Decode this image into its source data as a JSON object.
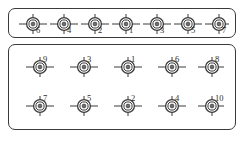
{
  "diagram": {
    "stroke_color": "#3a3a3a",
    "label_color": "#2e2e2e",
    "background_color": "#ffffff",
    "panels": [
      {
        "id": "panel-top",
        "name": "single-row-group",
        "label_position": "subscript",
        "rows": [
          {
            "name": "row-1",
            "markers": [
              {
                "label": "6"
              },
              {
                "label": "4"
              },
              {
                "label": "2"
              },
              {
                "label": "1"
              },
              {
                "label": "3"
              },
              {
                "label": "5"
              },
              {
                "label": "7"
              }
            ]
          }
        ]
      },
      {
        "id": "panel-bottom",
        "name": "two-row-group",
        "label_position": "superscript",
        "rows": [
          {
            "name": "row-1",
            "markers": [
              {
                "label": "9"
              },
              {
                "label": "3"
              },
              {
                "label": "1"
              },
              {
                "label": "6"
              },
              {
                "label": "8"
              }
            ]
          },
          {
            "name": "row-2",
            "markers": [
              {
                "label": "7"
              },
              {
                "label": "5"
              },
              {
                "label": "2"
              },
              {
                "label": "4"
              },
              {
                "label": "10"
              }
            ]
          }
        ]
      }
    ]
  }
}
